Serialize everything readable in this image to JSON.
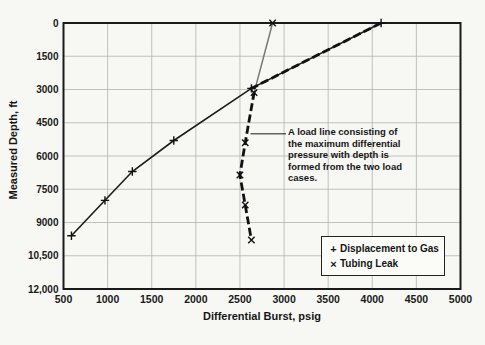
{
  "chart_data": {
    "type": "line",
    "title": "",
    "xlabel": "Differential Burst, psig",
    "ylabel": "Measured Depth, ft",
    "xlim": [
      500,
      5000
    ],
    "ylim": [
      0,
      12000
    ],
    "y_axis_inverted": true,
    "grid": true,
    "legend_position": "lower right",
    "x_ticks": [
      500,
      1000,
      1500,
      2000,
      2500,
      3000,
      3500,
      4000,
      4500,
      5000
    ],
    "x_tick_labels": [
      "500",
      "1000",
      "1500",
      "2000",
      "2500",
      "3000",
      "3500",
      "4000",
      "4500",
      "5000"
    ],
    "y_ticks": [
      0,
      1500,
      3000,
      4500,
      6000,
      7500,
      9000,
      10500,
      12000
    ],
    "y_tick_labels": [
      "0",
      "1500",
      "3000",
      "4500",
      "6000",
      "7500",
      "9000",
      "10,500",
      "12,000"
    ],
    "series": [
      {
        "name": "Displacement to Gas",
        "marker": "+",
        "line_style": "solid",
        "color": "#1c1c1c",
        "points": [
          [
            4100,
            0
          ],
          [
            2630,
            2950
          ],
          [
            1750,
            5300
          ],
          [
            1280,
            6700
          ],
          [
            970,
            8000
          ],
          [
            590,
            9600
          ]
        ]
      },
      {
        "name": "Tubing Leak",
        "marker": "x",
        "line_style": "solid",
        "color": "#787878",
        "points": [
          [
            2870,
            0
          ],
          [
            2660,
            3140
          ],
          [
            2560,
            5400
          ],
          [
            2500,
            6860
          ],
          [
            2560,
            8210
          ],
          [
            2630,
            9790
          ]
        ]
      }
    ],
    "load_line": {
      "description": "Maximum differential pressure envelope drawn as heavy dashed line over the two load cases",
      "style": "dashed-heavy",
      "color": "#111111",
      "points": [
        [
          4100,
          0
        ],
        [
          2630,
          2950
        ],
        [
          2660,
          3140
        ],
        [
          2560,
          5400
        ],
        [
          2500,
          6860
        ],
        [
          2560,
          8210
        ],
        [
          2630,
          9790
        ]
      ]
    },
    "annotation": {
      "text": "A load line consisting of\nthe maximum differential\npressure with depth is\nformed from the two load\ncases.",
      "leader_depth": 5000,
      "leader_x_value": 2620
    }
  },
  "labels": {
    "xlabel": "Differential Burst, psig",
    "ylabel": "Measured Depth, ft"
  },
  "legend": {
    "items": [
      {
        "marker": "+",
        "label": "Displacement to Gas"
      },
      {
        "marker": "×",
        "label": "Tubing Leak"
      }
    ]
  }
}
